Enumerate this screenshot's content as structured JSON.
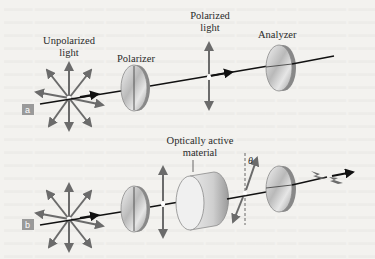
{
  "figure": {
    "panels": [
      {
        "tag": "a",
        "labels": {
          "source": [
            "Unpolarized",
            "light"
          ],
          "polarizer": "Polarizer",
          "polarized": [
            "Polarized",
            "light"
          ],
          "analyzer": "Analyzer"
        }
      },
      {
        "tag": "b",
        "labels": {
          "material": [
            "Optically active",
            "material"
          ],
          "angle": "θ"
        }
      }
    ],
    "colors": {
      "background": "#f3f2ef",
      "ghost_text": "#e4e3df",
      "arrow_gray": "#6b6b6b",
      "ray": "#111111",
      "tag_bg": "#9a9a9a",
      "label_text": "#2a2a2a"
    }
  }
}
